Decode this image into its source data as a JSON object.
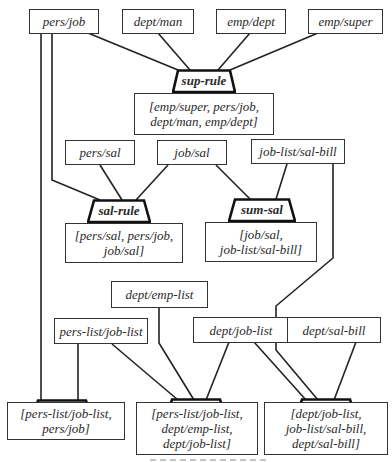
{
  "diagram": {
    "type": "rule-dependency-diagram",
    "relations": [
      {
        "id": "pers_job",
        "label": "pers/job"
      },
      {
        "id": "dept_man",
        "label": "dept/man"
      },
      {
        "id": "emp_dept",
        "label": "emp/dept"
      },
      {
        "id": "emp_super",
        "label": "emp/super"
      },
      {
        "id": "pers_sal",
        "label": "pers/sal"
      },
      {
        "id": "job_sal",
        "label": "job/sal"
      },
      {
        "id": "job_list_sal_bill",
        "label": "job-list/sal-bill"
      },
      {
        "id": "dept_emp_list",
        "label": "dept/emp-list"
      },
      {
        "id": "pers_list_job_list",
        "label": "pers-list/job-list"
      },
      {
        "id": "dept_job_list",
        "label": "dept/job-list"
      },
      {
        "id": "dept_sal_bill",
        "label": "dept/sal-bill"
      }
    ],
    "rules": [
      {
        "id": "sup_rule",
        "label": "sup-rule",
        "result_lines": [
          "[emp/super, pers/job,",
          "dept/man, emp/dept]"
        ]
      },
      {
        "id": "sal_rule",
        "label": "sal-rule",
        "result_lines": [
          "[pers/sal, pers/job,",
          "job/sal]"
        ]
      },
      {
        "id": "sum_sal",
        "label": "sum-sal",
        "result_lines": [
          "[job/sal,",
          "job-list/sal-bill]"
        ]
      },
      {
        "id": "list_job",
        "label": "list-job",
        "result_lines": [
          "[pers-list/job-list,",
          "pers/job]"
        ]
      },
      {
        "id": "dep_job",
        "label": "dep-job",
        "result_lines": [
          "[pers-list/job-list,",
          "dept/emp-list,",
          "dept/job-list]"
        ]
      },
      {
        "id": "dep_sal",
        "label": "dep-sal",
        "result_lines": [
          "[dept/job-list,",
          "job-list/sal-bill,",
          "dept/sal-bill]"
        ]
      }
    ],
    "edges": [
      {
        "from": "pers/job",
        "to": "sup-rule"
      },
      {
        "from": "dept/man",
        "to": "sup-rule"
      },
      {
        "from": "emp/dept",
        "to": "sup-rule"
      },
      {
        "from": "emp/super",
        "to": "sup-rule"
      },
      {
        "from": "pers/job",
        "to": "sal-rule"
      },
      {
        "from": "pers/sal",
        "to": "sal-rule"
      },
      {
        "from": "job/sal",
        "to": "sal-rule"
      },
      {
        "from": "job/sal",
        "to": "sum-sal"
      },
      {
        "from": "job-list/sal-bill",
        "to": "sum-sal"
      },
      {
        "from": "job-list/sal-bill",
        "to": "dep-sal"
      },
      {
        "from": "pers/job",
        "to": "list-job"
      },
      {
        "from": "pers-list/job-list",
        "to": "list-job"
      },
      {
        "from": "pers-list/job-list",
        "to": "dep-job"
      },
      {
        "from": "dept/emp-list",
        "to": "dep-job"
      },
      {
        "from": "dept/job-list",
        "to": "dep-job"
      },
      {
        "from": "dept/job-list",
        "to": "dep-sal"
      },
      {
        "from": "dept/sal-bill",
        "to": "dep-sal"
      }
    ],
    "colors": {
      "line": "#222222",
      "box_border": "#333333",
      "text": "#2a2a2a",
      "background": "#ffffff"
    }
  }
}
